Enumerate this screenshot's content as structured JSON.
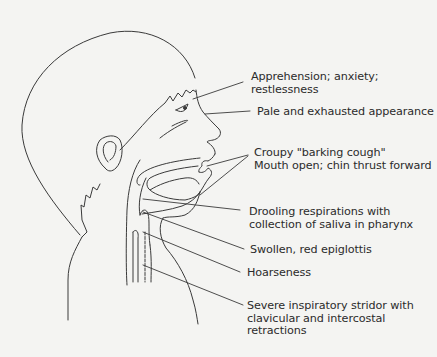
{
  "figure": {
    "labels": [
      {
        "id": "apprehension",
        "text": "Apprehension; anxiety;\nrestlessness",
        "x": 251,
        "y": 71
      },
      {
        "id": "pale",
        "text": "Pale and exhausted appearance",
        "x": 257,
        "y": 107
      },
      {
        "id": "croupy",
        "text": "Croupy \"barking cough\"\nMouth open; chin thrust forward",
        "x": 254,
        "y": 148
      },
      {
        "id": "drooling",
        "text": "Drooling respirations with\ncollection of saliva in pharynx",
        "x": 249,
        "y": 206
      },
      {
        "id": "epiglottis",
        "text": "Swollen, red epiglottis",
        "x": 250,
        "y": 245
      },
      {
        "id": "hoarseness",
        "text": "Hoarseness",
        "x": 247,
        "y": 268
      },
      {
        "id": "stridor",
        "text": "Severe inspiratory stridor with\nclavicular and intercostal\nretractions",
        "x": 247,
        "y": 300
      }
    ],
    "colors": {
      "background": "#f4f4f2",
      "line": "#3a3a3a",
      "text": "#2b2b2b"
    }
  }
}
